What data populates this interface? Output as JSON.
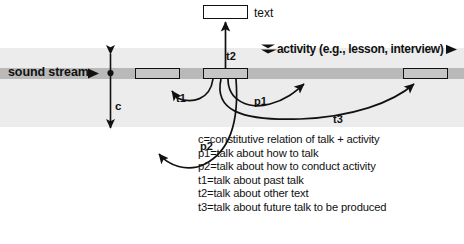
{
  "diagram": {
    "bands": {
      "activity_band_color": "#ececec",
      "sound_stream_color": "#b9b9b9",
      "talk_box_fill": "#c6c6c6",
      "text_box_fill": "#ffffff",
      "stroke_color": "#111111"
    },
    "labels": {
      "text_box": "text",
      "sound_stream": "sound stream",
      "activity": "activity (e.g., lesson, interview)",
      "c": "c",
      "t1": "t1",
      "t2": "t2",
      "p1": "p1",
      "p2": "p2",
      "t3": "t3"
    },
    "legend": [
      "c=constitutive relation of talk + activity",
      "p1=talk about how to talk",
      "p2=talk about how to conduct activity",
      "t1=talk about past talk",
      "t2=talk about other text",
      "t3=talk about future talk to be produced"
    ],
    "talk_boxes": [
      {
        "name": "past-talk-box"
      },
      {
        "name": "current-talk-box"
      },
      {
        "name": "future-talk-box"
      }
    ]
  }
}
